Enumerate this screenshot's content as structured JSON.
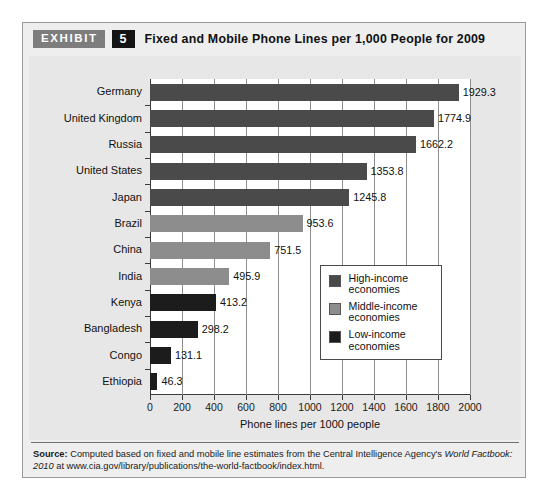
{
  "exhibit": {
    "badge_label": "EXHIBIT",
    "number": "5",
    "title": "Fixed and Mobile Phone Lines per 1,000 People for 2009"
  },
  "source": {
    "lead": "Source:",
    "text_part1": " Computed based on fixed and mobile line estimates from the Central Intelligence Agency's ",
    "italic1": "World Factbook:",
    "text_part2": " ",
    "italic2": "2010",
    "text_part3": " at www.cia.gov/library/publications/the-world-factbook/index.html."
  },
  "legend": {
    "position": "inside-right",
    "items": [
      {
        "label": "High-income\neconomies",
        "color": "#4a4a4a"
      },
      {
        "label": "Middle-income\neconomies",
        "color": "#8d8d8d"
      },
      {
        "label": "Low-income\neconomies",
        "color": "#1c1c1c"
      }
    ]
  },
  "chart_data": {
    "type": "bar",
    "orientation": "horizontal",
    "title": "Fixed and Mobile Phone Lines per 1,000 People for 2009",
    "xlabel": "Phone lines per 1000 people",
    "ylabel": "",
    "xlim": [
      0,
      2000
    ],
    "xticks": [
      0,
      200,
      400,
      600,
      800,
      1000,
      1200,
      1400,
      1600,
      1800,
      2000
    ],
    "xticklabels": [
      "0",
      "200",
      "400",
      "600",
      "800",
      "1000",
      "1200",
      "1400",
      "1600",
      "1800",
      "2000"
    ],
    "grid": "vertical",
    "categories": [
      "Germany",
      "United Kingdom",
      "Russia",
      "United States",
      "Japan",
      "Brazil",
      "China",
      "India",
      "Kenya",
      "Bangladesh",
      "Congo",
      "Ethiopia"
    ],
    "values": [
      1929.3,
      1774.9,
      1662.2,
      1353.8,
      1245.8,
      953.6,
      751.5,
      495.9,
      413.2,
      298.2,
      131.1,
      46.3
    ],
    "value_labels": [
      "1929.3",
      "1774.9",
      "1662.2",
      "1353.8",
      "1245.8",
      "953.6",
      "751.5",
      "495.9",
      "413.2",
      "298.2",
      "131.1",
      "46.3"
    ],
    "groups": [
      "High-income economies",
      "High-income economies",
      "High-income economies",
      "High-income economies",
      "High-income economies",
      "Middle-income economies",
      "Middle-income economies",
      "Middle-income economies",
      "Low-income economies",
      "Low-income economies",
      "Low-income economies",
      "Low-income economies"
    ],
    "colors": [
      "#4a4a4a",
      "#4a4a4a",
      "#4a4a4a",
      "#4a4a4a",
      "#4a4a4a",
      "#8d8d8d",
      "#8d8d8d",
      "#8d8d8d",
      "#1c1c1c",
      "#1c1c1c",
      "#1c1c1c",
      "#1c1c1c"
    ]
  }
}
